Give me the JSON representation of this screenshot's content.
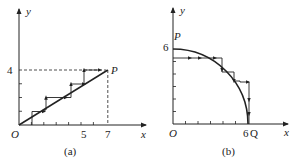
{
  "figure_a": {
    "caption": "(a)",
    "x_axis_label": "x",
    "y_axis_label": "y",
    "origin_label": "O",
    "x_tick_labels": [
      "5",
      "7"
    ],
    "y_tick_labels": [
      "4"
    ],
    "point_label": "P",
    "description": "Straight line from O to P(7,4) approximated by staircase path of horizontal and vertical arrow segments; dashed lines from P to axes"
  },
  "figure_b": {
    "caption": "(b)",
    "x_axis_label": "x",
    "y_axis_label": "y",
    "origin_label": "O",
    "x_tick_labels": [
      "6"
    ],
    "y_tick_labels": [
      "6"
    ],
    "point_label_start": "P",
    "point_label_end": "Q",
    "description": "Quarter circle of radius 6 from P(0,6) to Q(6,0) approximated by staircase path of horizontal and vertical arrow segments"
  }
}
